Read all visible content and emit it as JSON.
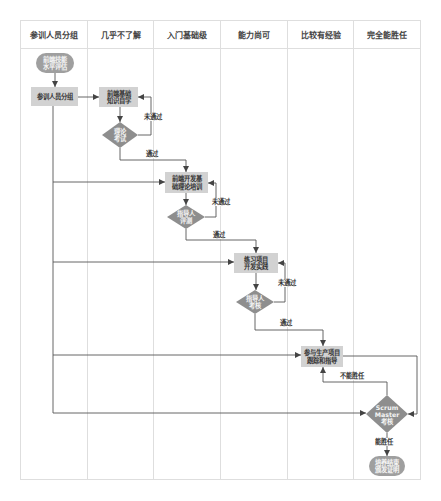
{
  "diagram": {
    "type": "swimlane-flowchart",
    "columns": [
      "参训人员分组",
      "几乎不了解",
      "入门基础级",
      "能力尚可",
      "比较有经验",
      "完全能胜任"
    ]
  },
  "nodes": {
    "start": {
      "type": "terminator",
      "lane": "参训人员分组",
      "text": "前端技能\n水平评估"
    },
    "grouping": {
      "type": "process",
      "lane": "参训人员分组",
      "text": "参训人员分组"
    },
    "self_study": {
      "type": "process",
      "lane": "几乎不了解",
      "text": "前端基础\n知识自学"
    },
    "theory_exam": {
      "type": "decision",
      "lane": "几乎不了解",
      "text": "理论\n考试"
    },
    "basic_training": {
      "type": "process",
      "lane": "入门基础级",
      "text": "前端开发基\n础理论培训"
    },
    "mentor_review": {
      "type": "decision",
      "lane": "入门基础级",
      "text": "指导人\n评测"
    },
    "practice_project": {
      "type": "process",
      "lane": "能力尚可",
      "text": "练习项目\n开发实践"
    },
    "mentor_assessment": {
      "type": "decision",
      "lane": "能力尚可",
      "text": "指导人\n考核"
    },
    "production_project": {
      "type": "process",
      "lane": "比较有经验",
      "text": "参与生产项目\n跟踪和指导"
    },
    "scrum_master_review": {
      "type": "decision",
      "lane": "完全能胜任",
      "text": "Scrum\nMaster\n考核"
    },
    "end": {
      "type": "terminator",
      "lane": "完全能胜任",
      "text": "培养结束\n颁发证明"
    }
  },
  "edges": [
    {
      "from": "start",
      "to": "grouping",
      "label": ""
    },
    {
      "from": "grouping",
      "to": "self_study",
      "label": ""
    },
    {
      "from": "grouping",
      "to": "basic_training",
      "label": ""
    },
    {
      "from": "grouping",
      "to": "practice_project",
      "label": ""
    },
    {
      "from": "grouping",
      "to": "production_project",
      "label": ""
    },
    {
      "from": "grouping",
      "to": "scrum_master_review",
      "label": ""
    },
    {
      "from": "self_study",
      "to": "theory_exam",
      "label": ""
    },
    {
      "from": "theory_exam",
      "to": "self_study",
      "label": "未通过"
    },
    {
      "from": "theory_exam",
      "to": "basic_training",
      "label": "通过"
    },
    {
      "from": "basic_training",
      "to": "mentor_review",
      "label": ""
    },
    {
      "from": "mentor_review",
      "to": "basic_training",
      "label": "未通过"
    },
    {
      "from": "mentor_review",
      "to": "practice_project",
      "label": "通过"
    },
    {
      "from": "practice_project",
      "to": "mentor_assessment",
      "label": ""
    },
    {
      "from": "mentor_assessment",
      "to": "practice_project",
      "label": "未通过"
    },
    {
      "from": "mentor_assessment",
      "to": "production_project",
      "label": "通过"
    },
    {
      "from": "production_project",
      "to": "scrum_master_review",
      "label": ""
    },
    {
      "from": "scrum_master_review",
      "to": "production_project",
      "label": "不能胜任"
    },
    {
      "from": "scrum_master_review",
      "to": "end",
      "label": "能胜任"
    }
  ],
  "colors": {
    "process_fill": "#d2d2d2",
    "decision_fill": "#8e8e8e",
    "terminator_fill": "#9f9f9f",
    "edge": "#555555",
    "grid": "#dedede"
  }
}
